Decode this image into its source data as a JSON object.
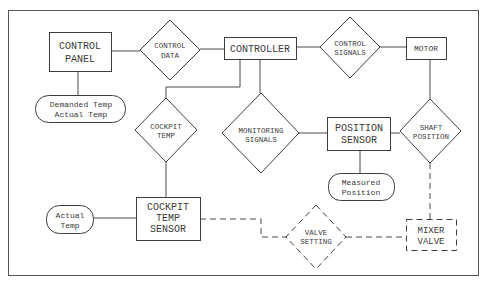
{
  "diagram": {
    "type": "data-flow",
    "entities": [
      {
        "id": "control_panel",
        "lines": [
          "CONTROL",
          "PANEL"
        ]
      },
      {
        "id": "controller",
        "lines": [
          "CONTROLLER"
        ]
      },
      {
        "id": "motor",
        "lines": [
          "MOTOR"
        ]
      },
      {
        "id": "position_sensor",
        "lines": [
          "POSITION",
          "SENSOR"
        ]
      },
      {
        "id": "cockpit_temp_sensor",
        "lines": [
          "COCKPIT",
          "TEMP",
          "SENSOR"
        ]
      },
      {
        "id": "mixer_valve",
        "lines": [
          "MIXER",
          "VALVE"
        ],
        "style": "dashed"
      }
    ],
    "flows": [
      {
        "id": "control_data",
        "lines": [
          "CONTROL",
          "DATA"
        ]
      },
      {
        "id": "control_signals",
        "lines": [
          "CONTROL",
          "SIGNALS"
        ]
      },
      {
        "id": "cockpit_temp",
        "lines": [
          "COCKPIT",
          "TEMP"
        ]
      },
      {
        "id": "monitoring_signals",
        "lines": [
          "MONITORING",
          "SIGNALS"
        ]
      },
      {
        "id": "shaft_position",
        "lines": [
          "SHAFT",
          "POSITION"
        ]
      },
      {
        "id": "valve_setting",
        "lines": [
          "VALVE",
          "SETTING"
        ],
        "style": "dashed"
      }
    ],
    "data_items": [
      {
        "id": "demanded_actual_temp",
        "lines": [
          "Demanded Temp",
          "Actual Temp"
        ]
      },
      {
        "id": "measured_position",
        "lines": [
          "Measured",
          "Position"
        ]
      },
      {
        "id": "actual_temp",
        "lines": [
          "Actual",
          "Temp"
        ]
      }
    ],
    "connections": [
      {
        "from": "control_panel",
        "to": "control_data"
      },
      {
        "from": "control_data",
        "to": "controller"
      },
      {
        "from": "controller",
        "to": "control_signals"
      },
      {
        "from": "control_signals",
        "to": "motor"
      },
      {
        "from": "control_panel",
        "to": "demanded_actual_temp"
      },
      {
        "from": "controller",
        "to": "cockpit_temp"
      },
      {
        "from": "controller",
        "to": "monitoring_signals"
      },
      {
        "from": "monitoring_signals",
        "to": "position_sensor"
      },
      {
        "from": "position_sensor",
        "to": "shaft_position"
      },
      {
        "from": "motor",
        "to": "shaft_position"
      },
      {
        "from": "position_sensor",
        "to": "measured_position"
      },
      {
        "from": "cockpit_temp",
        "to": "cockpit_temp_sensor"
      },
      {
        "from": "actual_temp",
        "to": "cockpit_temp_sensor"
      },
      {
        "from": "cockpit_temp_sensor",
        "to": "valve_setting",
        "style": "dashed"
      },
      {
        "from": "valve_setting",
        "to": "mixer_valve",
        "style": "dashed"
      },
      {
        "from": "shaft_position",
        "to": "mixer_valve",
        "style": "dashed"
      }
    ]
  }
}
